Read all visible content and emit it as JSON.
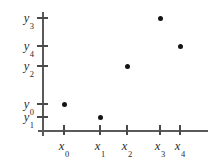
{
  "chart_data": {
    "type": "scatter",
    "title": "",
    "xlabel": "",
    "ylabel": "",
    "grid": false,
    "legend": null,
    "x_tick_labels": [
      "x0",
      "x1",
      "x2",
      "x3",
      "x4"
    ],
    "y_tick_labels": [
      "y3",
      "y4",
      "y2",
      "y0",
      "y1"
    ],
    "x_axis_ticks": [
      {
        "symbol": "x",
        "sub": "0"
      },
      {
        "symbol": "x",
        "sub": "1"
      },
      {
        "symbol": "x",
        "sub": "2"
      },
      {
        "symbol": "x",
        "sub": "3"
      },
      {
        "symbol": "x",
        "sub": "4"
      }
    ],
    "y_axis_ticks": [
      {
        "symbol": "y",
        "sub": "3"
      },
      {
        "symbol": "y",
        "sub": "4"
      },
      {
        "symbol": "y",
        "sub": "2"
      },
      {
        "symbol": "y",
        "sub": "0"
      },
      {
        "symbol": "y",
        "sub": "1"
      }
    ],
    "points": [
      {
        "x_label": "x0",
        "y_label": "y0"
      },
      {
        "x_label": "x1",
        "y_label": "y1"
      },
      {
        "x_label": "x2",
        "y_label": "y2"
      },
      {
        "x_label": "x3",
        "y_label": "y3"
      },
      {
        "x_label": "x4",
        "y_label": "y4"
      }
    ],
    "marker_color": "#141414",
    "axis_color": "#5a5a5a"
  },
  "axes": {
    "y_ticks_px": [
      18,
      46,
      66,
      104,
      117
    ],
    "x_ticks_px": [
      64,
      100,
      127,
      160,
      180
    ],
    "points_px": [
      {
        "x": 64,
        "y": 104
      },
      {
        "x": 100,
        "y": 117
      },
      {
        "x": 127,
        "y": 66
      },
      {
        "x": 160,
        "y": 18
      },
      {
        "x": 180,
        "y": 46
      }
    ]
  },
  "y_labels": [
    {
      "symbol": "y",
      "sub": "3",
      "top": 18
    },
    {
      "symbol": "y",
      "sub": "4",
      "top": 46
    },
    {
      "symbol": "y",
      "sub": "2",
      "top": 66
    },
    {
      "symbol": "y",
      "sub": "0",
      "top": 104
    },
    {
      "symbol": "y",
      "sub": "1",
      "top": 117
    }
  ],
  "x_labels": [
    {
      "symbol": "x",
      "sub": "0",
      "left": 64
    },
    {
      "symbol": "x",
      "sub": "1",
      "left": 100
    },
    {
      "symbol": "x",
      "sub": "2",
      "left": 127
    },
    {
      "symbol": "x",
      "sub": "3",
      "left": 160
    },
    {
      "symbol": "x",
      "sub": "4",
      "left": 180
    }
  ]
}
